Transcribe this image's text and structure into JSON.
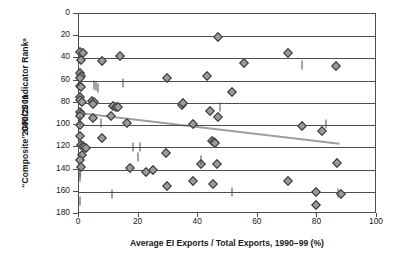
{
  "chart_data": {
    "type": "scatter",
    "title": "",
    "xlabel": "Average EI Exports / Total Exports, 1990–99 (%)",
    "ylabel_line1": "“Composite” GRICS Indicator Rankᵃ",
    "ylabel_line2": "2000/2001",
    "xlim": [
      0,
      100
    ],
    "ylim": [
      0,
      180
    ],
    "y_inverted": true,
    "xticks": [
      0,
      20,
      40,
      60,
      80,
      100
    ],
    "yticks": [
      0,
      20,
      40,
      60,
      80,
      100,
      120,
      140,
      160,
      180
    ],
    "grid": "horizontal",
    "legend": "none",
    "marker_colors": {
      "diamond_fill": "#9a9a9a",
      "diamond_edge": "#333333",
      "bar": "#4a4a4a",
      "trendline": "#9e9e9e",
      "axis": "#4d4d4d"
    },
    "trendline": {
      "type": "linear-fit",
      "x_start": 0,
      "y_start": 90,
      "x_end": 88,
      "y_end": 118
    },
    "series": [
      {
        "name": "countries-diamond",
        "marker": "diamond",
        "points": [
          [
            0.4,
            34
          ],
          [
            1.2,
            35
          ],
          [
            0.6,
            41
          ],
          [
            0.5,
            53
          ],
          [
            0.6,
            56
          ],
          [
            0.5,
            58
          ],
          [
            0.4,
            65
          ],
          [
            0.6,
            66
          ],
          [
            0.5,
            75
          ],
          [
            0.4,
            77
          ],
          [
            1.0,
            79
          ],
          [
            0.5,
            88
          ],
          [
            0.6,
            90
          ],
          [
            0.4,
            92
          ],
          [
            0.5,
            100
          ],
          [
            0.4,
            110
          ],
          [
            0.6,
            118
          ],
          [
            1.2,
            119
          ],
          [
            1.8,
            120
          ],
          [
            2.4,
            121
          ],
          [
            1.0,
            127
          ],
          [
            0.5,
            131
          ],
          [
            0.6,
            138
          ],
          [
            7.6,
            42
          ],
          [
            13.6,
            38
          ],
          [
            4.4,
            78
          ],
          [
            5.2,
            79
          ],
          [
            4.6,
            81
          ],
          [
            11.4,
            83
          ],
          [
            12.4,
            84
          ],
          [
            13.0,
            84
          ],
          [
            4.8,
            94
          ],
          [
            10.8,
            92
          ],
          [
            16.2,
            98
          ],
          [
            7.6,
            112
          ],
          [
            17.0,
            139
          ],
          [
            22.4,
            142
          ],
          [
            24.8,
            140
          ],
          [
            29.2,
            125
          ],
          [
            29.4,
            155
          ],
          [
            29.6,
            58
          ],
          [
            34.6,
            82
          ],
          [
            34.8,
            80
          ],
          [
            38.4,
            99
          ],
          [
            38.4,
            150
          ],
          [
            41.0,
            135
          ],
          [
            42.8,
            56
          ],
          [
            44.6,
            114
          ],
          [
            45.4,
            115
          ],
          [
            45.6,
            116
          ],
          [
            46.4,
            135
          ],
          [
            45.0,
            153
          ],
          [
            46.6,
            21
          ],
          [
            44.0,
            87
          ],
          [
            46.6,
            93
          ],
          [
            51.4,
            70
          ],
          [
            55.4,
            44
          ],
          [
            70.2,
            35
          ],
          [
            70.0,
            150
          ],
          [
            74.8,
            101
          ],
          [
            79.4,
            160
          ],
          [
            79.6,
            172
          ],
          [
            81.4,
            105
          ],
          [
            86.4,
            47
          ],
          [
            86.6,
            134
          ],
          [
            87.8,
            162
          ]
        ]
      },
      {
        "name": "countries-bar",
        "marker": "vertical-bar",
        "points": [
          [
            0.3,
            96
          ],
          [
            0.3,
            143
          ],
          [
            0.3,
            147
          ],
          [
            0.3,
            168
          ],
          [
            5.0,
            64
          ],
          [
            5.6,
            65
          ],
          [
            6.4,
            67
          ],
          [
            7.4,
            98
          ],
          [
            11.0,
            162
          ],
          [
            14.8,
            62
          ],
          [
            18.2,
            120
          ],
          [
            20.4,
            120
          ],
          [
            19.8,
            129
          ],
          [
            41.0,
            131
          ],
          [
            47.4,
            84
          ],
          [
            51.4,
            160
          ],
          [
            74.8,
            46
          ],
          [
            83.0,
            99
          ],
          [
            87.0,
            161
          ]
        ]
      }
    ]
  }
}
